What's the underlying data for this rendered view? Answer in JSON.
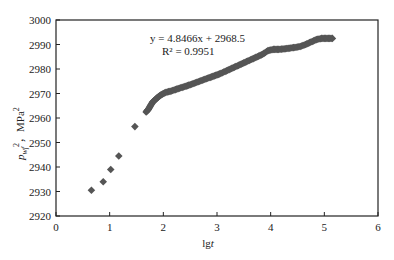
{
  "chart_data": {
    "type": "scatter",
    "title": "",
    "xlabel": "lgt",
    "ylabel": "p_wf^2, MPa^2",
    "xlim": [
      0,
      6
    ],
    "ylim": [
      2920,
      3000
    ],
    "xticks": [
      0,
      1,
      2,
      3,
      4,
      5,
      6
    ],
    "yticks": [
      2920,
      2930,
      2940,
      2950,
      2960,
      2970,
      2980,
      2990,
      3000
    ],
    "grid": false,
    "legend": "none",
    "marker": "diamond",
    "marker_color": "#555555",
    "annotation": {
      "equation": "y = 4.8466x + 2968.5",
      "r_squared": "R² = 0.9951"
    },
    "series": [
      {
        "name": "pwf2",
        "points": [
          [
            0.66,
            2930.5
          ],
          [
            0.88,
            2934.0
          ],
          [
            1.02,
            2939.0
          ],
          [
            1.17,
            2944.5
          ],
          [
            1.47,
            2956.5
          ],
          [
            1.68,
            2962.5
          ],
          [
            1.72,
            2963.5
          ],
          [
            1.76,
            2965.0
          ],
          [
            1.8,
            2966.5
          ],
          [
            1.85,
            2967.5
          ],
          [
            1.9,
            2968.5
          ],
          [
            1.96,
            2969.5
          ],
          [
            2.05,
            2970.5
          ],
          [
            2.15,
            2971.0
          ],
          [
            2.25,
            2971.8
          ],
          [
            2.35,
            2972.5
          ],
          [
            2.45,
            2973.2
          ],
          [
            2.55,
            2974.0
          ],
          [
            2.65,
            2974.8
          ],
          [
            2.75,
            2975.6
          ],
          [
            2.85,
            2976.4
          ],
          [
            2.95,
            2977.2
          ],
          [
            3.05,
            2978.0
          ],
          [
            3.15,
            2979.0
          ],
          [
            3.25,
            2980.0
          ],
          [
            3.35,
            2981.0
          ],
          [
            3.45,
            2982.0
          ],
          [
            3.55,
            2983.0
          ],
          [
            3.65,
            2984.0
          ],
          [
            3.75,
            2985.0
          ],
          [
            3.85,
            2986.0
          ],
          [
            3.95,
            2987.5
          ],
          [
            4.05,
            2988.0
          ],
          [
            4.15,
            2988.0
          ],
          [
            4.25,
            2988.2
          ],
          [
            4.35,
            2988.5
          ],
          [
            4.45,
            2988.8
          ],
          [
            4.55,
            2989.2
          ],
          [
            4.65,
            2990.0
          ],
          [
            4.75,
            2991.0
          ],
          [
            4.85,
            2992.0
          ],
          [
            4.95,
            2992.5
          ],
          [
            5.05,
            2992.5
          ],
          [
            5.15,
            2992.5
          ]
        ]
      }
    ]
  }
}
